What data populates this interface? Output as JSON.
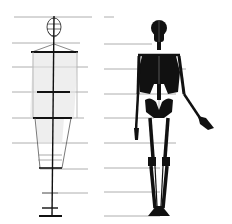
{
  "diagram": {
    "title": "",
    "figures": [
      {
        "name": "schematic-figure",
        "type": "proportion block figure"
      },
      {
        "name": "skeleton-figure",
        "type": "skeleton"
      }
    ],
    "guide_lines_y": [
      17,
      43,
      67,
      92,
      118,
      143,
      167,
      193,
      216
    ],
    "colors": {
      "background": "#ffffff",
      "ink": "#111111",
      "guide": "#9a9a9a",
      "shading": "#d4d4d4"
    },
    "labels": []
  }
}
